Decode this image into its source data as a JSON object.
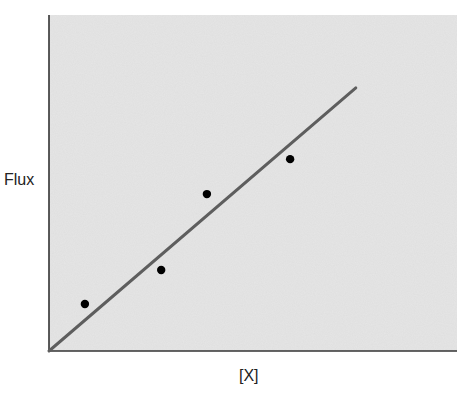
{
  "chart_data": {
    "type": "scatter",
    "title": "",
    "xlabel": "[X]",
    "ylabel": "Flux",
    "xlim": [
      0,
      10
    ],
    "ylim": [
      0,
      10
    ],
    "grid": false,
    "legend": null,
    "x_ticks": [],
    "y_ticks": [],
    "series": [
      {
        "name": "measured",
        "kind": "scatter",
        "color": "#000000",
        "points": [
          {
            "x": 0.88,
            "y": 1.4
          },
          {
            "x": 2.75,
            "y": 2.41
          },
          {
            "x": 3.87,
            "y": 4.67
          },
          {
            "x": 5.91,
            "y": 5.71
          }
        ]
      },
      {
        "name": "linear fit",
        "kind": "line",
        "color": "#5e5e5e",
        "points": [
          {
            "x": 0.0,
            "y": 0.0
          },
          {
            "x": 7.52,
            "y": 7.83
          }
        ]
      }
    ],
    "colors": {
      "plot_background": "#e6e6e6",
      "axis": "#333333"
    }
  },
  "labels": {
    "y_axis": "Flux",
    "x_axis": "[X]"
  }
}
